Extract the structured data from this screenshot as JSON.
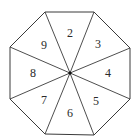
{
  "diagram": {
    "shape": "regular octagon divided into 8 triangular sectors from center",
    "colors": {
      "stroke": "#3a3a3a",
      "fill": "#ffffff",
      "text": "#2a2a2a",
      "center_dot": "#111111"
    },
    "center": [
      70,
      73
    ],
    "vertices": [
      [
        45,
        12
      ],
      [
        94,
        12
      ],
      [
        130,
        48
      ],
      [
        130,
        99
      ],
      [
        94,
        135
      ],
      [
        45,
        134
      ],
      [
        10,
        99
      ],
      [
        10,
        47
      ]
    ],
    "sectors": [
      {
        "label": "2",
        "pos": [
          70,
          33
        ]
      },
      {
        "label": "3",
        "pos": [
          98,
          44
        ]
      },
      {
        "label": "4",
        "pos": [
          108,
          73
        ]
      },
      {
        "label": "5",
        "pos": [
          96,
          101
        ]
      },
      {
        "label": "6",
        "pos": [
          70,
          113
        ]
      },
      {
        "label": "7",
        "pos": [
          44,
          100
        ]
      },
      {
        "label": "8",
        "pos": [
          33,
          73
        ]
      },
      {
        "label": "9",
        "pos": [
          44,
          45
        ]
      }
    ]
  }
}
